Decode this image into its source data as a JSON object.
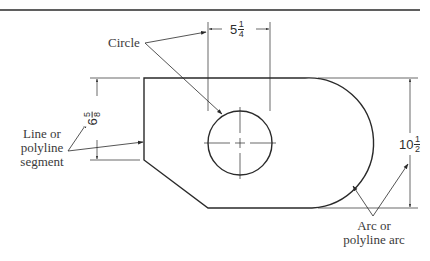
{
  "figure": {
    "type": "technical-drawing",
    "line_color": "#2a2a2a",
    "background": "#ffffff"
  },
  "callouts": {
    "circle": "Circle",
    "line_segment": [
      "Line or",
      "polyline",
      "segment"
    ],
    "arc": [
      "Arc or",
      "polyline arc"
    ]
  },
  "dimensions": {
    "circle_diameter": {
      "whole": "5",
      "num": "1",
      "den": "4"
    },
    "left_height": {
      "whole": "6",
      "num": "5",
      "den": "8"
    },
    "overall_height": {
      "whole": "10",
      "num": "1",
      "den": "2"
    }
  }
}
